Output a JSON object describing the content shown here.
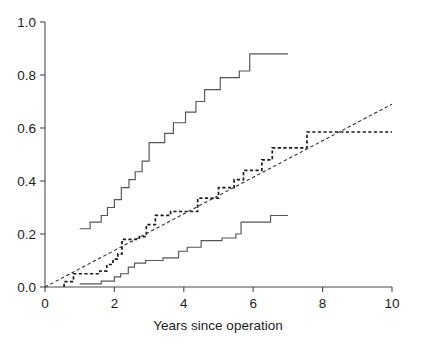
{
  "chart_data": {
    "type": "line",
    "title": "",
    "subtitle": "",
    "xlabel": "Years since operation",
    "ylabel": "",
    "xlim": [
      0,
      10
    ],
    "ylim": [
      0.0,
      1.0
    ],
    "grid": false,
    "legend": "none",
    "xticks": [
      0,
      2,
      4,
      6,
      8,
      10
    ],
    "xtick_labels": [
      "0",
      "2",
      "4",
      "6",
      "8",
      "10"
    ],
    "yticks": [
      0.0,
      0.2,
      0.4,
      0.6,
      0.8,
      1.0
    ],
    "ytick_labels": [
      "0.0",
      "0.2",
      "0.4",
      "0.6",
      "0.8",
      "1.0"
    ],
    "colors": {
      "solid_curve": "#555555",
      "dashed_step": "#1c1c1c",
      "dashed_reference_line": "#2a2a2a",
      "axis": "#4a4a4a",
      "background": "#ffffff"
    },
    "series": [
      {
        "name": "upper-solid-step",
        "style": "solid step",
        "points": [
          [
            1.0,
            0.22
          ],
          [
            1.3,
            0.22
          ],
          [
            1.3,
            0.245
          ],
          [
            1.62,
            0.245
          ],
          [
            1.62,
            0.27
          ],
          [
            1.8,
            0.27
          ],
          [
            1.8,
            0.3
          ],
          [
            2.0,
            0.3
          ],
          [
            2.0,
            0.33
          ],
          [
            2.2,
            0.33
          ],
          [
            2.2,
            0.375
          ],
          [
            2.42,
            0.375
          ],
          [
            2.42,
            0.405
          ],
          [
            2.6,
            0.405
          ],
          [
            2.6,
            0.435
          ],
          [
            2.8,
            0.435
          ],
          [
            2.8,
            0.475
          ],
          [
            3.0,
            0.475
          ],
          [
            3.0,
            0.545
          ],
          [
            3.45,
            0.545
          ],
          [
            3.45,
            0.58
          ],
          [
            3.7,
            0.58
          ],
          [
            3.7,
            0.62
          ],
          [
            4.05,
            0.62
          ],
          [
            4.05,
            0.66
          ],
          [
            4.35,
            0.66
          ],
          [
            4.35,
            0.7
          ],
          [
            4.6,
            0.7
          ],
          [
            4.6,
            0.745
          ],
          [
            5.05,
            0.745
          ],
          [
            5.05,
            0.79
          ],
          [
            5.6,
            0.79
          ],
          [
            5.6,
            0.815
          ],
          [
            5.9,
            0.815
          ],
          [
            5.9,
            0.88
          ],
          [
            7.0,
            0.88
          ]
        ]
      },
      {
        "name": "middle-dashed-step",
        "style": "dashed step",
        "points": [
          [
            0.55,
            0.0
          ],
          [
            0.55,
            0.02
          ],
          [
            0.82,
            0.02
          ],
          [
            0.82,
            0.05
          ],
          [
            1.58,
            0.05
          ],
          [
            1.58,
            0.06
          ],
          [
            1.78,
            0.06
          ],
          [
            1.78,
            0.085
          ],
          [
            1.96,
            0.085
          ],
          [
            1.96,
            0.105
          ],
          [
            2.1,
            0.105
          ],
          [
            2.1,
            0.125
          ],
          [
            2.22,
            0.125
          ],
          [
            2.22,
            0.18
          ],
          [
            2.72,
            0.18
          ],
          [
            2.72,
            0.19
          ],
          [
            2.92,
            0.19
          ],
          [
            2.92,
            0.235
          ],
          [
            3.18,
            0.235
          ],
          [
            3.18,
            0.27
          ],
          [
            3.62,
            0.27
          ],
          [
            3.62,
            0.285
          ],
          [
            4.4,
            0.285
          ],
          [
            4.4,
            0.335
          ],
          [
            5.0,
            0.335
          ],
          [
            5.0,
            0.375
          ],
          [
            5.45,
            0.375
          ],
          [
            5.45,
            0.405
          ],
          [
            5.72,
            0.405
          ],
          [
            5.72,
            0.44
          ],
          [
            6.25,
            0.44
          ],
          [
            6.25,
            0.48
          ],
          [
            6.55,
            0.48
          ],
          [
            6.55,
            0.525
          ],
          [
            7.55,
            0.525
          ],
          [
            7.55,
            0.585
          ],
          [
            10.0,
            0.585
          ]
        ]
      },
      {
        "name": "lower-solid-step",
        "style": "solid step",
        "points": [
          [
            1.0,
            0.012
          ],
          [
            1.62,
            0.012
          ],
          [
            1.62,
            0.022
          ],
          [
            2.0,
            0.022
          ],
          [
            2.0,
            0.038
          ],
          [
            2.18,
            0.038
          ],
          [
            2.18,
            0.05
          ],
          [
            2.4,
            0.05
          ],
          [
            2.4,
            0.075
          ],
          [
            2.58,
            0.075
          ],
          [
            2.58,
            0.09
          ],
          [
            2.9,
            0.09
          ],
          [
            2.9,
            0.1
          ],
          [
            3.4,
            0.1
          ],
          [
            3.4,
            0.11
          ],
          [
            3.85,
            0.11
          ],
          [
            3.85,
            0.135
          ],
          [
            4.1,
            0.135
          ],
          [
            4.1,
            0.15
          ],
          [
            4.5,
            0.15
          ],
          [
            4.5,
            0.175
          ],
          [
            5.1,
            0.175
          ],
          [
            5.1,
            0.185
          ],
          [
            5.5,
            0.185
          ],
          [
            5.5,
            0.2
          ],
          [
            5.65,
            0.2
          ],
          [
            5.65,
            0.245
          ],
          [
            6.5,
            0.245
          ],
          [
            6.5,
            0.27
          ],
          [
            7.0,
            0.27
          ]
        ]
      },
      {
        "name": "dashed-reference-line",
        "style": "dashed straight",
        "points": [
          [
            0.0,
            0.0
          ],
          [
            10.0,
            0.69
          ]
        ]
      }
    ]
  },
  "axis": {
    "x_title": "Years since operation"
  }
}
